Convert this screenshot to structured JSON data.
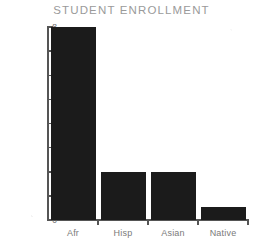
{
  "chart_data": {
    "type": "bar",
    "title": "STUDENT ENROLLMENT",
    "xlabel": "",
    "ylabel": "Percent of Total Student Body",
    "categories": [
      "Afr",
      "Hisp",
      "Asian",
      "Native"
    ],
    "values": [
      8,
      2,
      2,
      0.55
    ],
    "ylim": [
      0,
      8
    ],
    "yticks": [
      0,
      1,
      2,
      3,
      4,
      5,
      6,
      7,
      8
    ],
    "ytick_labels": [
      "0",
      "1",
      "2",
      "3",
      "4",
      "5",
      "6",
      "7",
      "8"
    ],
    "grid": false,
    "legend": false,
    "bar_color": "#1b1b1b",
    "axis_color": "#555555",
    "title_color": "#9a9a9a",
    "label_color": "#7a7a7a",
    "background": "#ffffff"
  }
}
